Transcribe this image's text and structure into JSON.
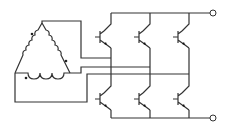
{
  "diagram": {
    "title": "",
    "winding": {
      "configuration": "delta",
      "coils": 3,
      "polarity_dots": 3
    },
    "bridge": {
      "legs": 3,
      "transistors_per_leg": 2,
      "transistor_symbol": "npn-transistor"
    },
    "terminals": [
      {
        "name": "positive-rail-terminal",
        "label": ""
      },
      {
        "name": "negative-rail-terminal",
        "label": ""
      }
    ],
    "colors": {
      "line": "#333333",
      "background": "#ffffff"
    }
  }
}
